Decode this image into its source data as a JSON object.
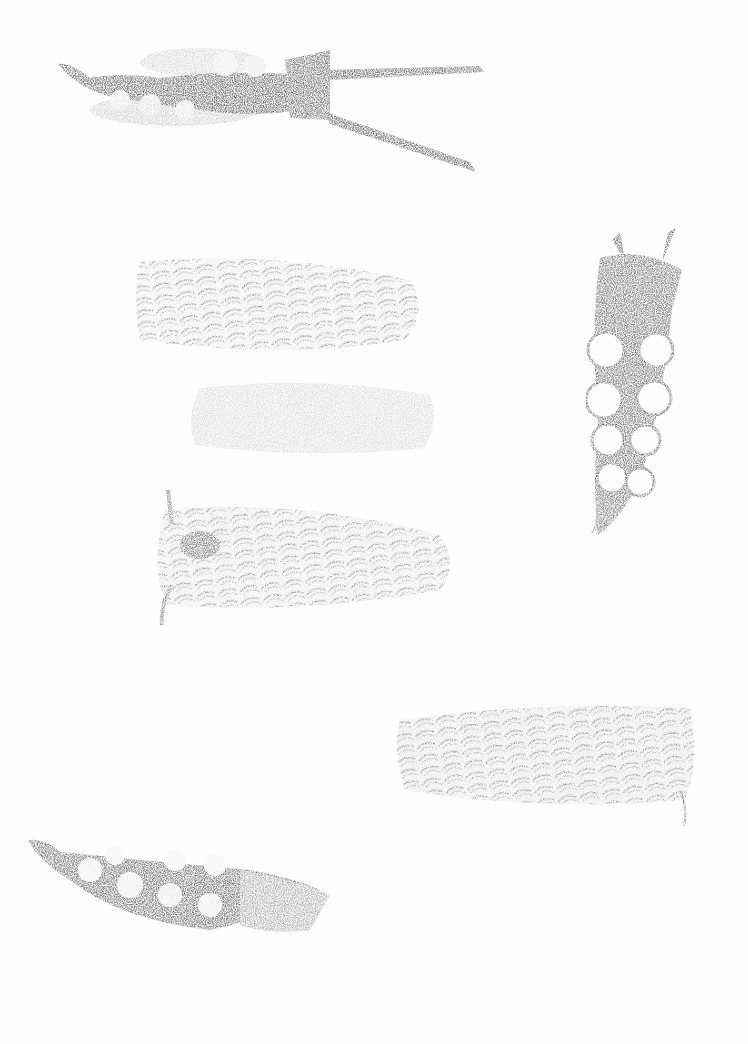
{
  "artwork": {
    "background": "#fefefe",
    "ink_dark": "#2e2e2e",
    "ink_mid": "#6a6a6a",
    "ink_light": "#b4b4b4",
    "figures": [
      {
        "id": "slug-1",
        "kind": "aeolid-with-rhinophores",
        "orientation": "horizontal",
        "x": 58,
        "y": 45,
        "w": 428,
        "h": 130
      },
      {
        "id": "slug-2",
        "kind": "cerata-covered-slug",
        "orientation": "horizontal",
        "x": 135,
        "y": 252,
        "w": 290,
        "h": 105
      },
      {
        "id": "slug-3",
        "kind": "faint-ghost-print",
        "orientation": "horizontal",
        "x": 185,
        "y": 375,
        "w": 255,
        "h": 85
      },
      {
        "id": "slug-4",
        "kind": "cerata-covered-slug",
        "orientation": "horizontal",
        "x": 155,
        "y": 488,
        "w": 300,
        "h": 138
      },
      {
        "id": "slug-5",
        "kind": "aeolid-vertical",
        "orientation": "vertical",
        "x": 582,
        "y": 215,
        "w": 110,
        "h": 325
      },
      {
        "id": "slug-6",
        "kind": "cerata-covered-slug",
        "orientation": "horizontal",
        "x": 392,
        "y": 697,
        "w": 310,
        "h": 128
      },
      {
        "id": "slug-7",
        "kind": "aeolid-partial",
        "orientation": "horizontal",
        "x": 28,
        "y": 835,
        "w": 310,
        "h": 115
      }
    ]
  }
}
